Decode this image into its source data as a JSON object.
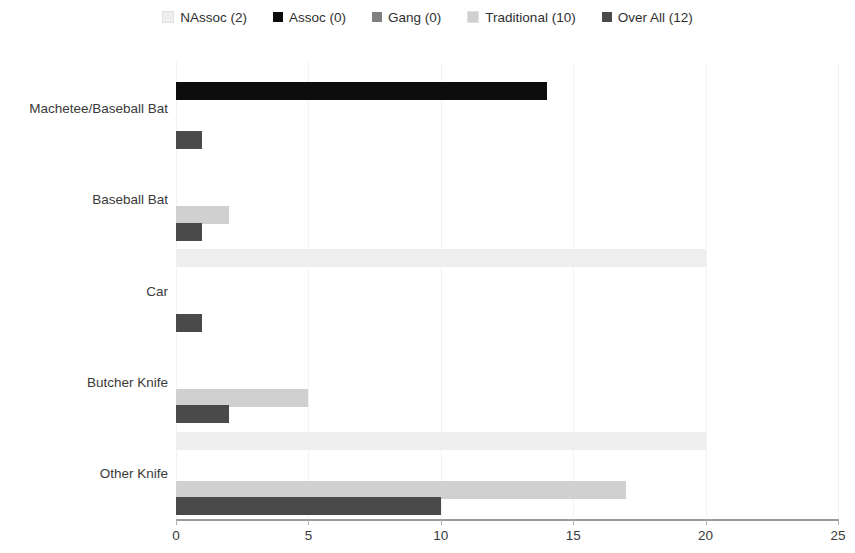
{
  "chart_data": {
    "type": "bar",
    "orientation": "horizontal",
    "title": "",
    "xlabel": "",
    "ylabel": "",
    "xlim": [
      0,
      25
    ],
    "xticks": [
      0,
      5,
      10,
      15,
      20,
      25
    ],
    "grid": true,
    "legend_position": "top",
    "categories": [
      "Machetee/Baseball Bat",
      "Baseball Bat",
      "Car",
      "Butcher Knife",
      "Other Knife"
    ],
    "series": [
      {
        "name": "NAssoc (2)",
        "legend_label": "NAssoc (2)",
        "color": "#eeeeee",
        "values": [
          0,
          0,
          20,
          0,
          20
        ]
      },
      {
        "name": "Assoc (0)",
        "legend_label": "Assoc (0)",
        "color": "#0d0d0d",
        "values": [
          14,
          0,
          0,
          0,
          0
        ]
      },
      {
        "name": "Gang (0)",
        "legend_label": "Gang (0)",
        "color": "#808080",
        "values": [
          0,
          0,
          0,
          0,
          0
        ]
      },
      {
        "name": "Traditional (10)",
        "legend_label": "Traditional (10)",
        "color": "#d0d0d0",
        "values": [
          0,
          2,
          0,
          5,
          17
        ]
      },
      {
        "name": "Over All (12)",
        "legend_label": "Over All (12)",
        "color": "#4a4a4a",
        "values": [
          1,
          1,
          1,
          2,
          10
        ]
      }
    ]
  }
}
